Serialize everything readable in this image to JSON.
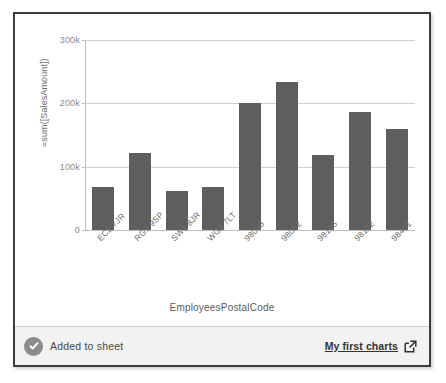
{
  "popup": {
    "status_bar": {
      "status_icon": "check-circle-icon",
      "status_text": "Added to sheet",
      "link_label": "My first charts",
      "link_icon": "external-link-icon"
    }
  },
  "chart_data": {
    "type": "bar",
    "title": "",
    "xlabel": "EmployeesPostalCode",
    "ylabel": "=sum([SalesAmount])",
    "categories": [
      "EC2 7JR",
      "RG1 9SP",
      "SW1 8JR",
      "WG2 7LT",
      "98033",
      "98052",
      "98105",
      "98122",
      "98401"
    ],
    "values": [
      68000,
      121000,
      62000,
      68000,
      200000,
      233000,
      118000,
      186000,
      159000
    ],
    "ylim": [
      0,
      300000
    ],
    "yticks": [
      0,
      100000,
      200000,
      300000
    ],
    "ytick_labels": [
      "0",
      "100k",
      "200k",
      "300k"
    ],
    "grid": true,
    "legend": "none",
    "bar_color": "#5e5e5e",
    "grid_color": "#d0d0d0",
    "axis_color": "#bdbdbd"
  }
}
